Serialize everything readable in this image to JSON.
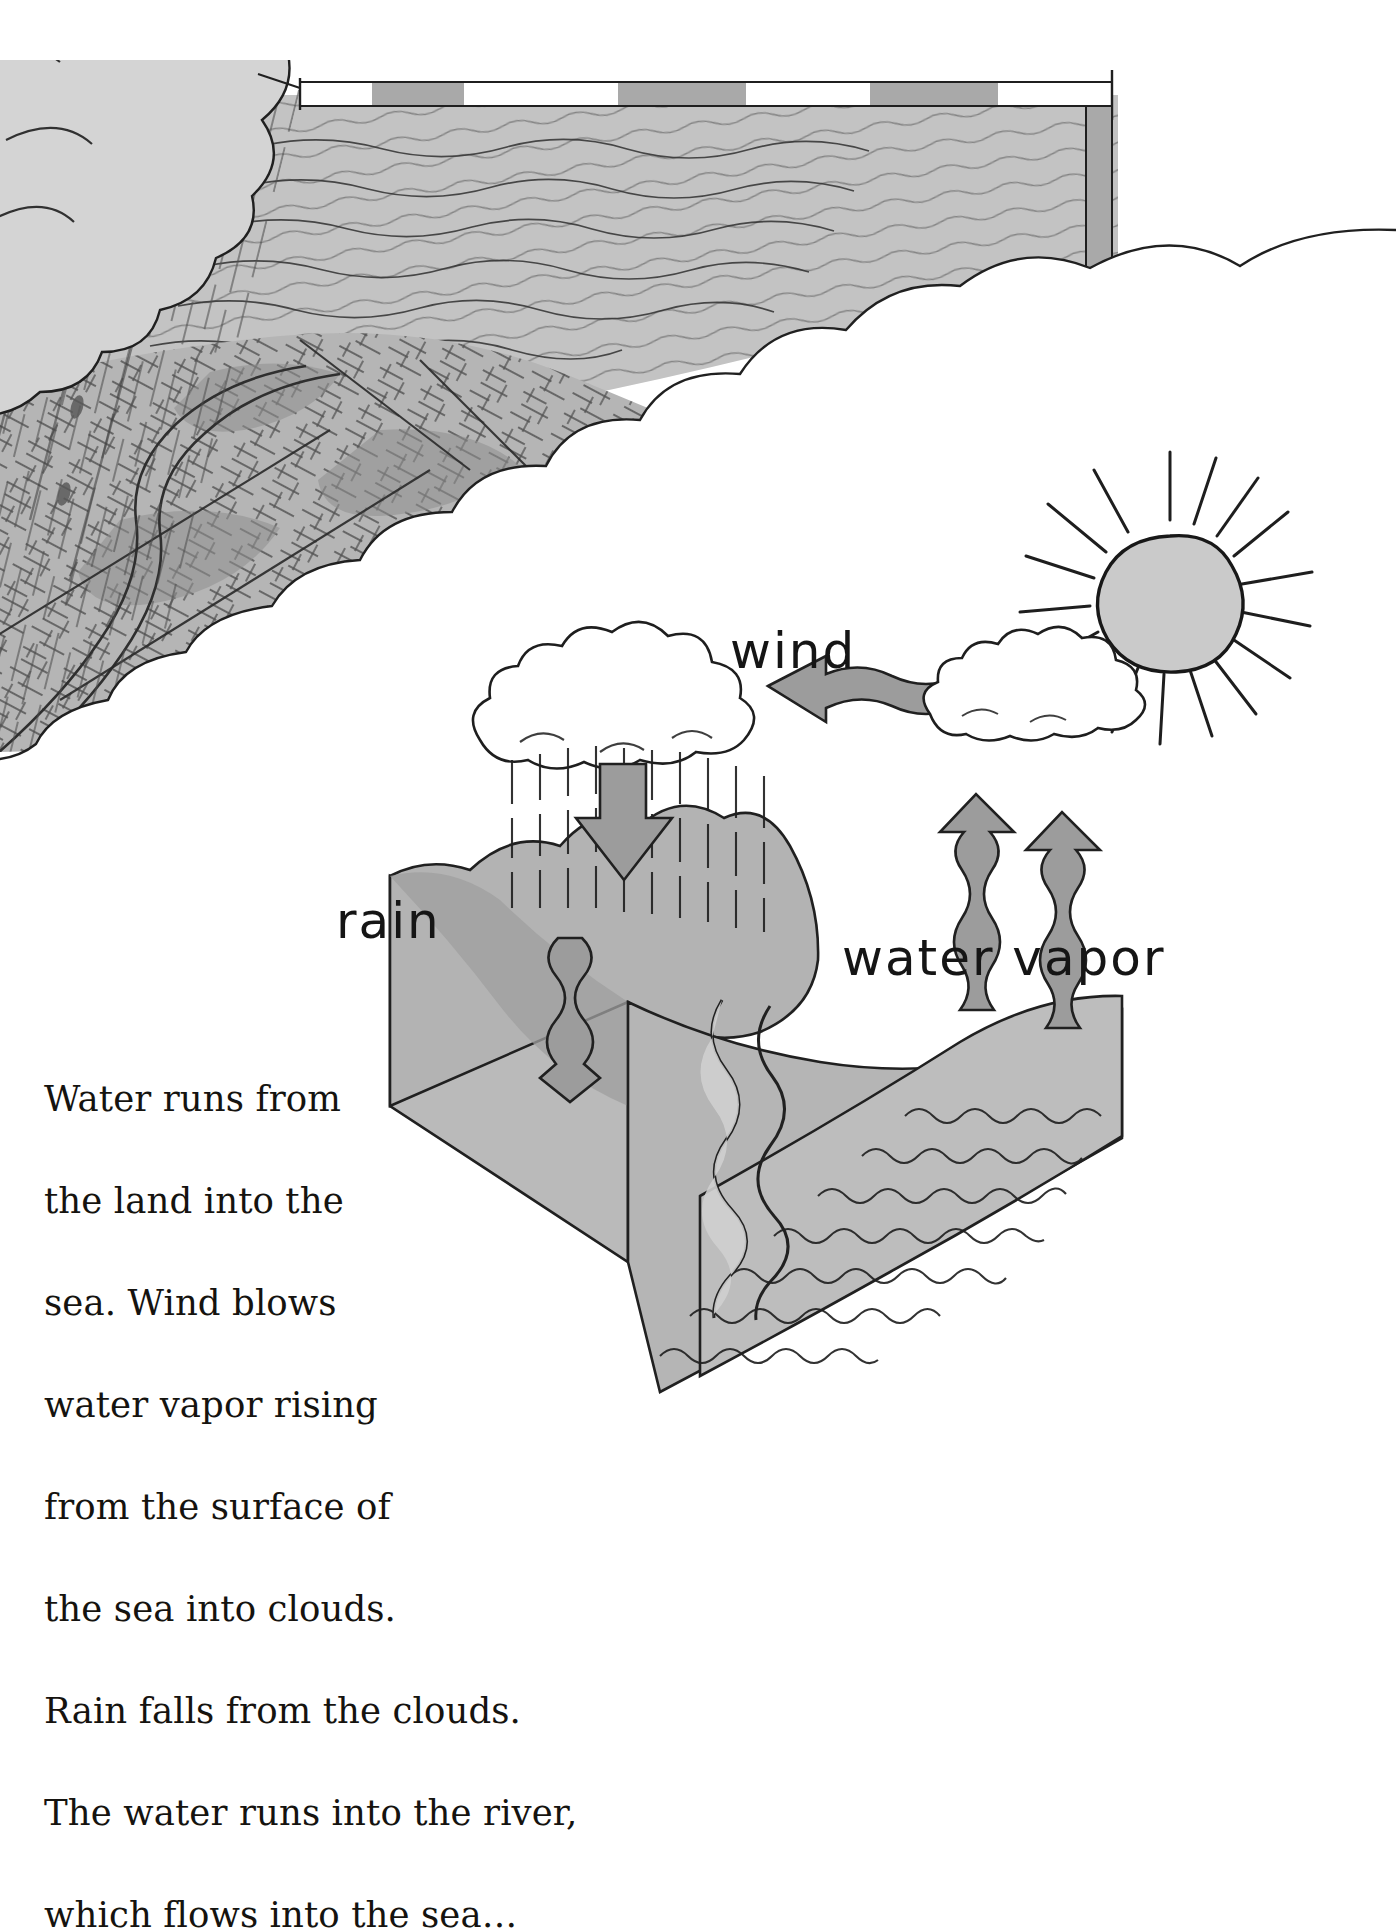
{
  "page": {
    "background_color": "#ffffff",
    "width": 1396,
    "height": 1872
  },
  "caption": {
    "text": "Water runs from the land into the sea. Wind blows water vapor rising from the surface of the sea into clouds. Rain falls from the clouds. The water runs into the river, which flows into the sea…",
    "lines": [
      "Water runs from",
      "the land into the",
      "sea. Wind blows",
      "water vapor rising",
      "from the surface of",
      "the sea into clouds.",
      "Rain falls from the clouds.",
      "The water runs into the river,",
      "which flows into the sea…"
    ],
    "color": "#15130f"
  },
  "labels": {
    "rain": "rain",
    "wind": "wind",
    "water_vapor": "water vapor"
  },
  "colors": {
    "ink": "#1a1a1a",
    "sea_gray": "#b9b9b9",
    "land_gray": "#b0b0b0",
    "land_gray_dark": "#9a9a9a",
    "arrow_gray": "#9d9d9d",
    "sun_gray": "#c8c8c8",
    "cloud_white": "#ffffff",
    "border_band": "#a8a8a8",
    "paper": "#ffffff"
  },
  "diagram": {
    "type": "illustration",
    "elements": [
      {
        "name": "aerial-photo-sea",
        "description": "Top-left aerial view of sea with wave hatching"
      },
      {
        "name": "aerial-photo-land",
        "description": "Aerial view of patterned farmland with river"
      },
      {
        "name": "rain-streaks-photo",
        "description": "Diagonal rain streaks falling over the aerial landscape"
      },
      {
        "name": "storm-cloud-top-left",
        "description": "Large gray storm cloud in upper-left corner"
      },
      {
        "name": "cloud-mask-right",
        "description": "White cloud shaped vignette masking the photo edge"
      },
      {
        "name": "sun",
        "description": "Hand-drawn sun with 16 rays",
        "rays": 16
      },
      {
        "name": "rain-cloud",
        "description": "Puffy white cloud raining over the mountain"
      },
      {
        "name": "rain-fall-arrow",
        "description": "Gray downward arrow inside the rain"
      },
      {
        "name": "wind-arrow",
        "description": "Gray wavy arrow pointing left from vapor cloud to rain cloud"
      },
      {
        "name": "vapor-cloud",
        "description": "Small white cloud at right end of wind arrow"
      },
      {
        "name": "vapor-arrow-left",
        "description": "Gray wavy arrow rising from sea"
      },
      {
        "name": "vapor-arrow-right",
        "description": "Gray wavy arrow rising from sea"
      },
      {
        "name": "terrain-block",
        "description": "3D block diagram of mountain, river and sea"
      },
      {
        "name": "river",
        "description": "Winding river running from mountain to sea"
      },
      {
        "name": "river-flow-arrow",
        "description": "Gray wavy arrow showing river flow direction"
      },
      {
        "name": "sea-surface",
        "description": "Sea surface with wavy line texture"
      }
    ]
  },
  "top_border": {
    "segments": [
      "gray",
      "white",
      "gray",
      "white",
      "gray",
      "white",
      "gray"
    ]
  }
}
